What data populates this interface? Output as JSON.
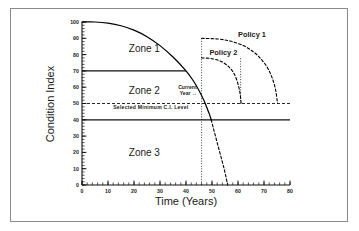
{
  "chart_data": {
    "type": "line",
    "title": "",
    "xlabel": "Time (Years)",
    "ylabel": "Condition Index",
    "xlim": [
      0,
      80
    ],
    "ylim": [
      0,
      100
    ],
    "xticks": [
      0,
      10,
      20,
      30,
      40,
      50,
      60,
      70,
      80
    ],
    "xtick_labels": [
      "0",
      "10",
      "20",
      "30",
      "40",
      "50",
      "60",
      "70",
      "80"
    ],
    "yticks": [
      0,
      10,
      20,
      30,
      40,
      50,
      60,
      70,
      80,
      90,
      100
    ],
    "ytick_labels": [
      "0",
      "10",
      "20",
      "30",
      "40",
      "50",
      "60",
      "70",
      "80",
      "90",
      "100"
    ],
    "minor_tick_interval_x": 2,
    "minor_tick_interval_y": 2,
    "grid": false,
    "legend_position": "inline-annotations",
    "series": [
      {
        "name": "Deterioration curve (observed)",
        "style": "solid",
        "color": "#000000",
        "points": [
          [
            0,
            100
          ],
          [
            5,
            100
          ],
          [
            10,
            99.3
          ],
          [
            15,
            97.7
          ],
          [
            20,
            95.0
          ],
          [
            25,
            91.0
          ],
          [
            30,
            85.5
          ],
          [
            35,
            78.5
          ],
          [
            40,
            70.0
          ],
          [
            43,
            63.5
          ],
          [
            45,
            58.0
          ],
          [
            47,
            51.5
          ],
          [
            48,
            47.5
          ],
          [
            49,
            43.5
          ],
          [
            49.7,
            40.0
          ]
        ]
      },
      {
        "name": "Deterioration curve (projected)",
        "style": "dashed",
        "color": "#000000",
        "points": [
          [
            49.7,
            40.0
          ],
          [
            50.5,
            35.0
          ],
          [
            51.5,
            29.0
          ],
          [
            52.5,
            23.0
          ],
          [
            53.5,
            17.0
          ],
          [
            54.5,
            11.0
          ],
          [
            55.3,
            5.5
          ],
          [
            56.0,
            0.0
          ]
        ]
      },
      {
        "name": "Policy 1",
        "style": "dashed",
        "color": "#000000",
        "rise_at_year": 46,
        "rise_to_ci": 90,
        "points": [
          [
            46,
            90
          ],
          [
            52,
            89.6
          ],
          [
            57,
            88.3
          ],
          [
            62,
            85.6
          ],
          [
            66,
            81.6
          ],
          [
            69,
            77.0
          ],
          [
            71.5,
            71.5
          ],
          [
            73.3,
            65.0
          ],
          [
            74.5,
            58.0
          ],
          [
            75.2,
            50.0
          ]
        ]
      },
      {
        "name": "Policy 2",
        "style": "dashed",
        "color": "#000000",
        "rise_at_year": 46,
        "rise_to_ci": 78,
        "points": [
          [
            46,
            78
          ],
          [
            50,
            77.5
          ],
          [
            53.5,
            75.8
          ],
          [
            56.5,
            72.5
          ],
          [
            58.6,
            68.0
          ],
          [
            60.0,
            62.0
          ],
          [
            60.8,
            56.0
          ],
          [
            61.2,
            50.0
          ]
        ]
      }
    ],
    "reference_lines": [
      {
        "name": "zone1-zone2-boundary",
        "axis": "y",
        "value": 70,
        "style": "solid",
        "x_from": 0,
        "x_to": 40
      },
      {
        "name": "zone2-zone3-boundary",
        "axis": "y",
        "value": 40,
        "style": "solid",
        "x_from": 0,
        "x_to": 80
      },
      {
        "name": "selected-minimum-ci-level",
        "axis": "y",
        "value": 50,
        "style": "dashed",
        "x_from": 0,
        "x_to": 80
      },
      {
        "name": "current-year",
        "axis": "x",
        "value": 46,
        "style": "dotted",
        "y_from": 0,
        "y_to": 90
      },
      {
        "name": "policy-2-end",
        "axis": "x",
        "value": 61,
        "style": "dotted",
        "y_from": 50,
        "y_to": 78
      }
    ],
    "zones": [
      {
        "label": "Zone 1",
        "ci_range": [
          70,
          100
        ],
        "label_x": 18,
        "label_y": 84
      },
      {
        "label": "Zone 2",
        "ci_range": [
          40,
          70
        ],
        "label_x": 18,
        "label_y": 58
      },
      {
        "label": "Zone 3",
        "ci_range": [
          0,
          40
        ],
        "label_x": 18,
        "label_y": 20
      }
    ],
    "annotations": [
      {
        "name": "current-year",
        "text": "Current",
        "text2": "Year",
        "arrow": "→",
        "x": 37,
        "y": 59
      },
      {
        "name": "selected-minimum-ci-level",
        "text": "Selected  Minimum  C.I.  Level",
        "x": 12,
        "y": 46.5
      },
      {
        "name": "policy-1",
        "text": "Policy  1",
        "x": 60,
        "y": 91
      },
      {
        "name": "policy-2",
        "text": "Policy  2",
        "x": 49,
        "y": 79.5
      }
    ]
  },
  "axes": {
    "x_title": "Time (Years)",
    "y_title": "Condition Index"
  },
  "colors": {
    "line": "#000000",
    "frame": "#8a8a8a",
    "background": "#ffffff",
    "text": "#1a1a1a"
  }
}
